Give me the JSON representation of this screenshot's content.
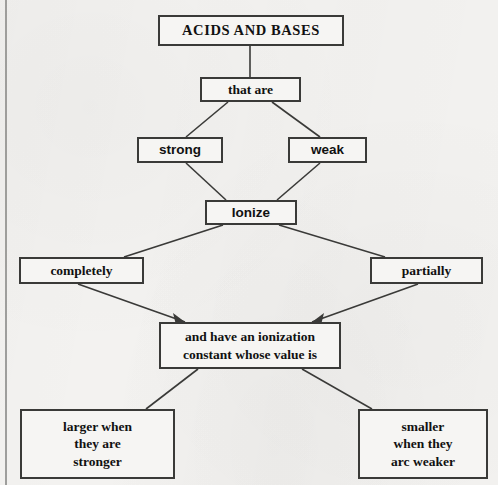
{
  "diagram": {
    "type": "concept-map",
    "title": "ACIDS AND BASES",
    "background_color": "#f3f2f0",
    "line_color": "#3a3a38",
    "text_color": "#111111",
    "nodes": [
      {
        "id": "title",
        "label": "ACIDS AND BASES"
      },
      {
        "id": "that-are",
        "label": "that are"
      },
      {
        "id": "strong",
        "label": "strong"
      },
      {
        "id": "weak",
        "label": "weak"
      },
      {
        "id": "ionize",
        "label": "Ionize"
      },
      {
        "id": "completely",
        "label": "completely"
      },
      {
        "id": "partially",
        "label": "partially"
      },
      {
        "id": "constant",
        "label": "and have an ionization\nconstant whose value is"
      },
      {
        "id": "larger",
        "label": "larger when\nthey are\nstronger"
      },
      {
        "id": "smaller",
        "label": "smaller\nwhen they\narc weaker"
      }
    ],
    "edges": [
      {
        "from": "title",
        "to": "that-are",
        "arrow": false
      },
      {
        "from": "that-are",
        "to": "strong",
        "arrow": false
      },
      {
        "from": "that-are",
        "to": "weak",
        "arrow": false
      },
      {
        "from": "strong",
        "to": "ionize",
        "arrow": false
      },
      {
        "from": "weak",
        "to": "ionize",
        "arrow": false
      },
      {
        "from": "ionize",
        "to": "completely",
        "arrow": false
      },
      {
        "from": "ionize",
        "to": "partially",
        "arrow": false
      },
      {
        "from": "completely",
        "to": "constant",
        "arrow": true
      },
      {
        "from": "partially",
        "to": "constant",
        "arrow": true
      },
      {
        "from": "constant",
        "to": "larger",
        "arrow": false
      },
      {
        "from": "constant",
        "to": "smaller",
        "arrow": false
      }
    ]
  }
}
